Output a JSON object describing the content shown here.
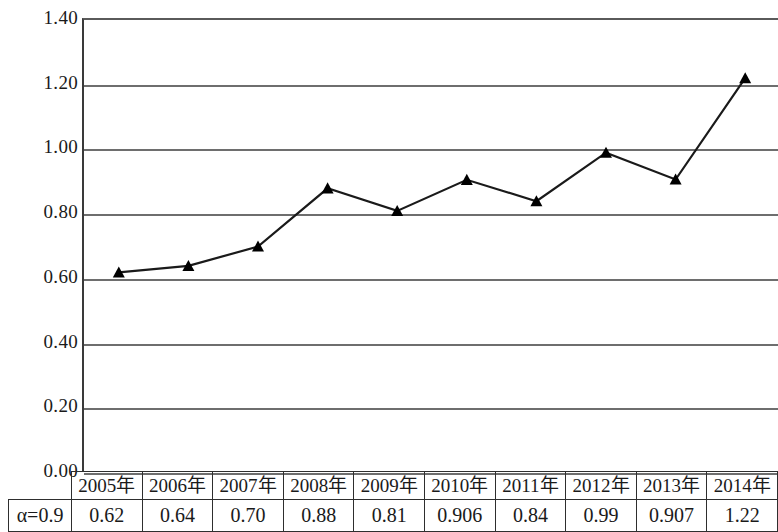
{
  "chart_data": {
    "type": "line",
    "title": "",
    "xlabel": "",
    "ylabel": "",
    "categories": [
      "2005年",
      "2006年",
      "2007年",
      "2008年",
      "2009年",
      "2010年",
      "2011年",
      "2012年",
      "2013年",
      "2014年"
    ],
    "series": [
      {
        "name": "α=0.9",
        "values": [
          0.62,
          0.64,
          0.7,
          0.88,
          0.81,
          0.906,
          0.84,
          0.99,
          0.907,
          1.22
        ]
      }
    ],
    "value_labels": [
      "0.62",
      "0.64",
      "0.70",
      "0.88",
      "0.81",
      "0.906",
      "0.84",
      "0.99",
      "0.907",
      "1.22"
    ],
    "ylim": [
      0.0,
      1.4
    ],
    "ytick_values": [
      1.4,
      1.2,
      1.0,
      0.8,
      0.6,
      0.4,
      0.2,
      0.0
    ],
    "ytick_labels": [
      "1.40",
      "1.20",
      "1.00",
      "0.80",
      "0.60",
      "0.40",
      "0.20",
      "0.00"
    ],
    "grid": true,
    "legend": "none",
    "marker": "triangle",
    "line_color": "#1a1a1a",
    "marker_color": "#000000",
    "grid_color": "#6e6e6e",
    "background": "#ffffff"
  },
  "data_table": {
    "row_label": "α=0.9",
    "header": [
      "2005年",
      "2006年",
      "2007年",
      "2008年",
      "2009年",
      "2010年",
      "2011年",
      "2012年",
      "2013年",
      "2014年"
    ],
    "values": [
      "0.62",
      "0.64",
      "0.70",
      "0.88",
      "0.81",
      "0.906",
      "0.84",
      "0.99",
      "0.907",
      "1.22"
    ]
  }
}
